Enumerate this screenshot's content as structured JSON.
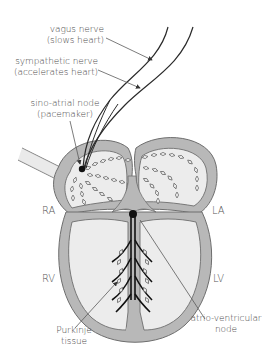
{
  "labels": {
    "vagus": {
      "line1": "vagus nerve",
      "line2": "(slows heart)"
    },
    "sympathetic": {
      "line1": "sympathetic nerve",
      "line2": "(accelerates heart)"
    },
    "sa_node": {
      "line1": "sino-atrial node",
      "line2": "(pacemaker)"
    },
    "ra": "RA",
    "la": "LA",
    "rv": "RV",
    "lv": "LV",
    "purkinje": {
      "line1": "Purkinje",
      "line2": "tissue"
    },
    "av_node": {
      "line1": "atrio-ventricular",
      "line2": "node"
    }
  },
  "colors": {
    "wall": "#b8b8b8",
    "wall_outline": "#6e6e6e",
    "chamber_fill": "#ececec",
    "nerve": "#2a2a2a",
    "node": "#111111",
    "leader": "#5a5a5a"
  }
}
